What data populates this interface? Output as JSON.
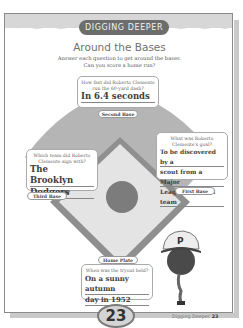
{
  "header": {
    "section_label": "DIGGING DEEPER",
    "title": "Around the Bases",
    "instructions_line1": "Answer each question to get around the bases.",
    "instructions_line2": "Can you score a home run?"
  },
  "bases": {
    "second": {
      "label": "Second Base",
      "question": "How fast did Roberto Clemente run the 60-yard dash?",
      "answer": "In 6.4 seconds"
    },
    "third": {
      "label": "Third Base",
      "question": "Which team did Roberto Clemente sign with?",
      "answer_line1": "The Brooklyn",
      "answer_line2": "Dodgers"
    },
    "first": {
      "label": "First Base",
      "question": "What was Roberto Clemente's goal?",
      "answer_line1": "To be discovered by a",
      "answer_line2": "scout from a Major",
      "answer_line3": "League Baseball team"
    },
    "home": {
      "label": "Home Plate",
      "question": "When was the tryout held?",
      "answer_line1": "On a sunny autumn",
      "answer_line2": "day in 1952"
    }
  },
  "illustration": {
    "cap_letter": "P"
  },
  "footer": {
    "page_badge": "23",
    "running_footer": "Digging Deeper",
    "page_number": "23"
  }
}
